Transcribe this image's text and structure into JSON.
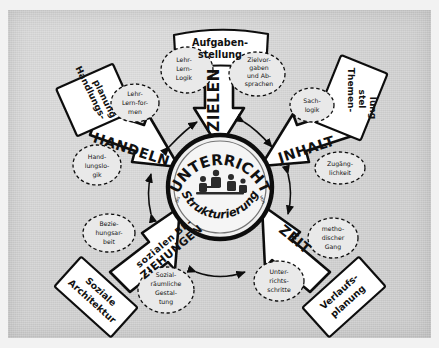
{
  "image": {
    "kind": "photograph-of-handdrawn-diagram",
    "language": "German",
    "paper_color": "#d2d2d2",
    "ink_color": "#111111",
    "border_color": "#f2f2f2"
  },
  "center": {
    "word_before": "als",
    "title": "UNTERRICHT",
    "subtitle": "Strukturierung",
    "word_after": "von",
    "illustration": "classroom-scene-icon"
  },
  "spokes": [
    {
      "id": "zielen",
      "label": "ZIELEN",
      "direction": "up",
      "banner": "Aufgaben-\nstellung",
      "banner_lines": [
        "Aufgaben-",
        "stellung"
      ],
      "bubbles": [
        {
          "lines": [
            "Lehr-",
            "Lern-",
            "Logik"
          ]
        },
        {
          "lines": [
            "Zielvor-",
            "gaben",
            "und Ab-",
            "sprachen"
          ]
        }
      ]
    },
    {
      "id": "inhalt",
      "label": "JNHALT",
      "direction": "upper-right",
      "banner": "Themen-\nstellung",
      "banner_lines": [
        "Themen-",
        "stel",
        "lung"
      ],
      "bubbles": [
        {
          "lines": [
            "Sach-",
            "logik"
          ]
        },
        {
          "lines": [
            "Zugäng-",
            "lichkeit"
          ]
        }
      ]
    },
    {
      "id": "zeit",
      "label": "ZEIT",
      "direction": "lower-right",
      "banner": "Verlaufs-\nplanung",
      "banner_lines": [
        "Verlaufs-",
        "planung"
      ],
      "bubbles": [
        {
          "lines": [
            "metho-",
            "discher",
            "Gang"
          ]
        },
        {
          "lines": [
            "Unter-",
            "richts-",
            "schritte"
          ]
        }
      ]
    },
    {
      "id": "beziehungen",
      "label": "sozialen BE-ZIEHUNGEN",
      "label_lines": [
        "sozialen BE-",
        "ZIEHUNGEN"
      ],
      "direction": "lower-left",
      "banner": "Soziale\nArchitektur",
      "banner_lines": [
        "Soziale",
        "Architektur"
      ],
      "bubbles": [
        {
          "lines": [
            "Bezie-",
            "hungsar-",
            "beit"
          ]
        },
        {
          "lines": [
            "Sozial-",
            "räumliche",
            "Gestal-",
            "tung"
          ]
        }
      ]
    },
    {
      "id": "handeln",
      "label": "HANDELN",
      "direction": "upper-left",
      "banner": "Handlungs-\nplanung",
      "banner_lines": [
        "Handlungs-",
        "planung"
      ],
      "bubbles": [
        {
          "lines": [
            "Lehr-",
            "Lern-for-",
            "men"
          ]
        },
        {
          "lines": [
            "Hand-",
            "lungslo-",
            "gik"
          ]
        }
      ]
    }
  ],
  "connectors": {
    "count": 5,
    "style": "double-headed-curved-arrow",
    "description": "thin double-headed arcs linking each pair of neighbouring spokes"
  }
}
